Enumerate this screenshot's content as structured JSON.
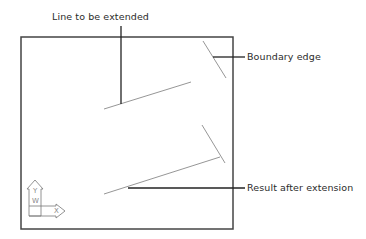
{
  "labels": {
    "line_to_extend": "Line to be extended",
    "boundary_edge": "Boundary edge",
    "result": "Result after extension"
  },
  "ucs_icon": {
    "x_axis": "X",
    "y_axis": "Y",
    "w_label": "W"
  },
  "colors": {
    "frame": "#444444",
    "geometry": "#8a8a8a",
    "leader": "#222222",
    "text": "#2b2b2b"
  }
}
